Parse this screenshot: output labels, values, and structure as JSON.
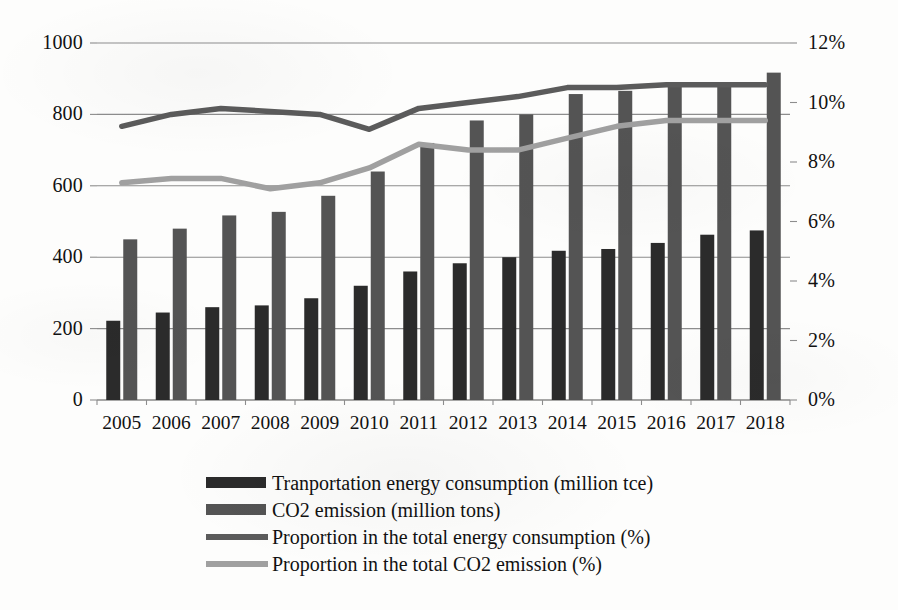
{
  "chart_data": {
    "type": "bar",
    "title": "",
    "subtitle": "",
    "xlabel": "",
    "ylabel": "",
    "categories": [
      "2005",
      "2006",
      "2007",
      "2008",
      "2009",
      "2010",
      "2011",
      "2012",
      "2013",
      "2014",
      "2015",
      "2016",
      "2017",
      "2018"
    ],
    "grid": true,
    "legend_position": "bottom",
    "axes": {
      "left": {
        "ticks": [
          "0",
          "200",
          "400",
          "600",
          "800",
          "1000"
        ],
        "tick_values": [
          0,
          200,
          400,
          600,
          800,
          1000
        ],
        "ylim": [
          0,
          1000
        ],
        "label": ""
      },
      "right": {
        "ticks": [
          "0%",
          "2%",
          "4%",
          "6%",
          "8%",
          "10%",
          "12%"
        ],
        "tick_values": [
          0,
          2,
          4,
          6,
          8,
          10,
          12
        ],
        "ylim": [
          0,
          12
        ],
        "label": ""
      }
    },
    "series": [
      {
        "name": "Tranportation energy consumption (million tce)",
        "kind": "bar",
        "axis": "left",
        "color": "#2b2b2b",
        "values": [
          222,
          245,
          260,
          265,
          285,
          320,
          360,
          383,
          400,
          418,
          423,
          440,
          463,
          475
        ]
      },
      {
        "name": "CO2 emission (million tons)",
        "kind": "bar",
        "axis": "left",
        "color": "#545454",
        "values": [
          450,
          480,
          517,
          527,
          572,
          640,
          720,
          783,
          800,
          857,
          866,
          886,
          887,
          917
        ]
      },
      {
        "name": "Proportion in the total energy consumption (%)",
        "kind": "line",
        "axis": "right",
        "color": "#5b5b5b",
        "values": [
          9.2,
          9.6,
          9.8,
          9.7,
          9.6,
          9.1,
          9.8,
          10.0,
          10.2,
          10.5,
          10.5,
          10.6,
          10.6,
          10.6
        ]
      },
      {
        "name": "Proportion in the total CO2 emission (%)",
        "kind": "line",
        "axis": "right",
        "color": "#a0a0a0",
        "values": [
          7.3,
          7.45,
          7.45,
          7.1,
          7.3,
          7.8,
          8.6,
          8.4,
          8.4,
          8.8,
          9.2,
          9.4,
          9.4,
          9.4
        ]
      }
    ]
  },
  "legend": {
    "items": [
      {
        "label": "Tranportation energy consumption (million tce)",
        "marker": "bar",
        "color": "#2b2b2b"
      },
      {
        "label": "CO2 emission (million tons)",
        "marker": "bar",
        "color": "#545454"
      },
      {
        "label": "Proportion in the total energy consumption (%)",
        "marker": "line",
        "color": "#5b5b5b"
      },
      {
        "label": "Proportion in the total CO2 emission (%)",
        "marker": "line",
        "color": "#a0a0a0"
      }
    ]
  }
}
